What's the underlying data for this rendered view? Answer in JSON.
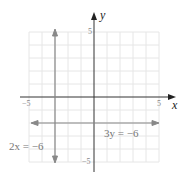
{
  "diagram": {
    "type": "coordinate-plane",
    "x_axis_label": "x",
    "y_axis_label": "y",
    "x_range": [
      -5,
      5
    ],
    "y_range": [
      -5,
      5
    ],
    "ticks": {
      "x_min_label": "−5",
      "x_max_label": "5",
      "y_max_label": "5",
      "y_min_label": "−5"
    },
    "lines": [
      {
        "equation": "2x = −6",
        "orientation": "vertical",
        "value": -3,
        "color": "#888888"
      },
      {
        "equation": "3y = −6",
        "orientation": "horizontal",
        "value": -2,
        "color": "#888888"
      }
    ],
    "colors": {
      "grid": "#e6e6e6",
      "axes": "#333333",
      "graph_lines": "#888888"
    }
  }
}
